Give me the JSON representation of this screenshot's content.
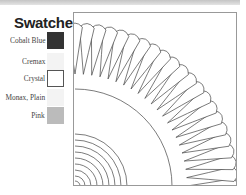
{
  "title": "Swatches",
  "swatches": [
    {
      "label": "Cobalt Blue",
      "color": "#333333",
      "border": "#333333"
    },
    {
      "label": "Cremax",
      "color": "#f3f3f3",
      "border": "#f3f3f3"
    },
    {
      "label": "Crystal",
      "color": "#ffffff",
      "border": "#555555"
    },
    {
      "label": "Monax, Plain",
      "color": "#f3f3f3",
      "border": "#f3f3f3"
    },
    {
      "label": "Pink",
      "color": "#bbbbbb",
      "border": "#bbbbbb"
    }
  ],
  "plate": {
    "view": "quarter",
    "line_color": "#444444",
    "inner_rings": [
      5,
      10,
      16,
      22,
      28,
      34,
      40,
      46,
      52
    ],
    "outer_ring": 97,
    "petals": {
      "count": 22,
      "tip_radius": 112,
      "outer_radius": 163
    }
  }
}
